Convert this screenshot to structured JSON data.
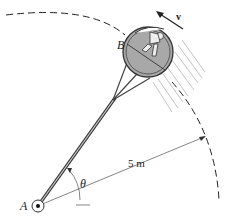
{
  "diagram": {
    "labels": {
      "point_a": "A",
      "point_b": "B",
      "angle": "θ",
      "radius": "5 m",
      "velocity": "v"
    },
    "colors": {
      "line": "#333333",
      "capsule_fill": "#a8a8a8",
      "dashed_path": "#222222",
      "motion_lines": "#9a9a9a"
    }
  }
}
